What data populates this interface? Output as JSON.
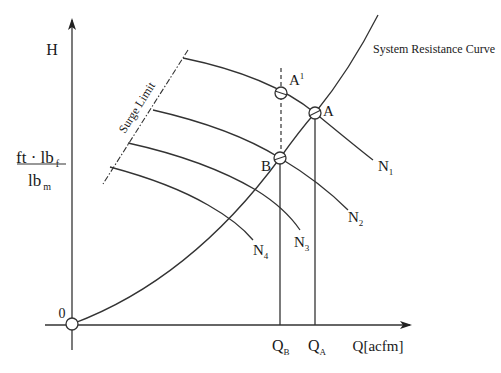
{
  "diagram": {
    "y_axis": {
      "label": "H",
      "unit_numerator": "ft · lb",
      "unit_numerator_sub": "f",
      "unit_denominator": "lb",
      "unit_denominator_sub": "m"
    },
    "x_axis": {
      "label": "Q[acfm]"
    },
    "origin_label": "0",
    "system_curve_label": "System Resistance Curve",
    "surge_limit_label": "Surge Limit",
    "points": [
      {
        "id": "A",
        "label": "A",
        "sup": ""
      },
      {
        "id": "A1",
        "label": "A",
        "sup": "1"
      },
      {
        "id": "B",
        "label": "B",
        "sup": ""
      }
    ],
    "speed_curves": [
      {
        "label": "N",
        "sub": "1"
      },
      {
        "label": "N",
        "sub": "2"
      },
      {
        "label": "N",
        "sub": "3"
      },
      {
        "label": "N",
        "sub": "4"
      }
    ],
    "flow_markers": [
      {
        "label": "Q",
        "sub": "B"
      },
      {
        "label": "Q",
        "sub": "A"
      }
    ],
    "colors": {
      "line": "#333333",
      "text": "#1a1a1a",
      "background": "#ffffff"
    }
  }
}
